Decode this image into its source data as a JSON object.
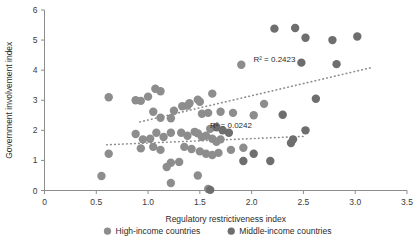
{
  "chart_data": {
    "type": "scatter",
    "title": "",
    "xlabel": "Regulatory restrictiveness index",
    "ylabel": "Government involvement index",
    "xlim": [
      0,
      3.5
    ],
    "ylim": [
      0,
      6
    ],
    "xticks": [
      "0",
      "0.5",
      "1.0",
      "1.5",
      "2.0",
      "2.5",
      "3.0",
      "3.5"
    ],
    "xtick_values": [
      0,
      0.5,
      1.0,
      1.5,
      2.0,
      2.5,
      3.0,
      3.5
    ],
    "yticks": [
      "0",
      "1",
      "2",
      "3",
      "4",
      "5",
      "6"
    ],
    "ytick_values": [
      0,
      1,
      2,
      3,
      4,
      5,
      6
    ],
    "grid": false,
    "legend_position": "bottom",
    "marker_size": 4.2,
    "series": [
      {
        "name": "High-income countries",
        "color": "#8d8d8d",
        "points": [
          [
            0.62,
            3.1
          ],
          [
            0.88,
            3.0
          ],
          [
            0.93,
            2.98
          ],
          [
            1.0,
            3.12
          ],
          [
            1.07,
            3.38
          ],
          [
            1.12,
            3.3
          ],
          [
            1.05,
            2.62
          ],
          [
            1.12,
            2.42
          ],
          [
            1.22,
            2.4
          ],
          [
            1.25,
            2.65
          ],
          [
            1.33,
            2.8
          ],
          [
            1.38,
            2.82
          ],
          [
            1.4,
            2.9
          ],
          [
            1.48,
            3.02
          ],
          [
            1.5,
            2.95
          ],
          [
            1.52,
            2.55
          ],
          [
            1.62,
            3.22
          ],
          [
            1.58,
            2.58
          ],
          [
            1.7,
            2.62
          ],
          [
            1.82,
            2.58
          ],
          [
            1.9,
            4.18
          ],
          [
            2.02,
            2.5
          ],
          [
            2.12,
            2.88
          ],
          [
            1.32,
            1.92
          ],
          [
            1.38,
            1.82
          ],
          [
            1.45,
            1.95
          ],
          [
            1.48,
            1.9
          ],
          [
            1.52,
            1.78
          ],
          [
            1.56,
            1.82
          ],
          [
            1.6,
            2.05
          ],
          [
            1.62,
            1.72
          ],
          [
            1.66,
            1.62
          ],
          [
            1.7,
            1.7
          ],
          [
            1.35,
            1.45
          ],
          [
            1.42,
            1.38
          ],
          [
            1.5,
            1.3
          ],
          [
            1.56,
            1.22
          ],
          [
            1.62,
            1.18
          ],
          [
            1.68,
            1.25
          ],
          [
            0.88,
            1.88
          ],
          [
            0.95,
            1.7
          ],
          [
            1.02,
            1.72
          ],
          [
            1.08,
            1.92
          ],
          [
            1.15,
            1.78
          ],
          [
            1.22,
            1.92
          ],
          [
            0.93,
            1.4
          ],
          [
            1.05,
            1.45
          ],
          [
            1.12,
            1.35
          ],
          [
            1.22,
            0.92
          ],
          [
            1.18,
            0.78
          ],
          [
            1.3,
            0.95
          ],
          [
            0.62,
            1.22
          ],
          [
            0.55,
            0.48
          ],
          [
            1.48,
            0.5
          ],
          [
            1.22,
            0.25
          ],
          [
            1.58,
            0.05
          ],
          [
            1.8,
            1.35
          ],
          [
            1.92,
            1.42
          ]
        ]
      },
      {
        "name": "Middle-income countries",
        "color": "#6e6e6e",
        "points": [
          [
            2.22,
            5.38
          ],
          [
            2.42,
            5.4
          ],
          [
            2.52,
            5.08
          ],
          [
            2.78,
            5.0
          ],
          [
            2.48,
            4.25
          ],
          [
            2.82,
            4.2
          ],
          [
            3.02,
            5.12
          ],
          [
            2.62,
            3.05
          ],
          [
            2.3,
            2.52
          ],
          [
            2.52,
            2.0
          ],
          [
            2.38,
            1.58
          ],
          [
            2.4,
            1.7
          ],
          [
            2.02,
            1.22
          ],
          [
            1.92,
            0.98
          ],
          [
            2.18,
            0.98
          ],
          [
            1.72,
            2.0
          ],
          [
            1.78,
            1.92
          ],
          [
            1.66,
            2.1
          ],
          [
            1.6,
            0.02
          ]
        ]
      }
    ],
    "trendlines": [
      {
        "name": "high-income-trendline",
        "label": "R² = 0.2423",
        "r_squared": "0.2423",
        "color": "#8d8d8d",
        "style": "dotted",
        "x_start": 0.92,
        "y_start": 2.28,
        "x_end": 3.15,
        "y_end": 4.08,
        "label_x": 2.22,
        "label_y": 4.28
      },
      {
        "name": "middle-income-trendline",
        "label": "R² = 0.0242",
        "r_squared": "0.0242",
        "color": "#8d8d8d",
        "style": "dotted",
        "x_start": 0.6,
        "y_start": 1.52,
        "x_end": 2.52,
        "y_end": 1.8,
        "label_x": 1.8,
        "label_y": 2.08
      }
    ]
  },
  "legend": {
    "items": [
      {
        "label": "High-income countries",
        "color": "#8d8d8d"
      },
      {
        "label": "Middle-income countries",
        "color": "#6e6e6e"
      }
    ]
  }
}
